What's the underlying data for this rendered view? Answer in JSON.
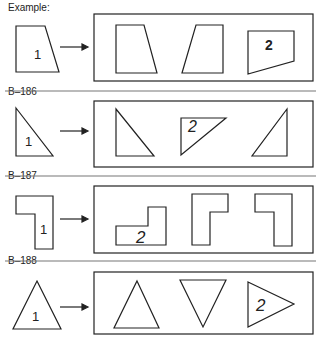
{
  "problems": [
    {
      "label": "Example:",
      "given_number": "1",
      "answer_number": "2"
    },
    {
      "label": "B–186",
      "given_number": "1",
      "answer_number": "2"
    },
    {
      "label": "B–187",
      "given_number": "1",
      "answer_number": "2"
    },
    {
      "label": "B–188",
      "given_number": "1",
      "answer_number": "2"
    }
  ]
}
